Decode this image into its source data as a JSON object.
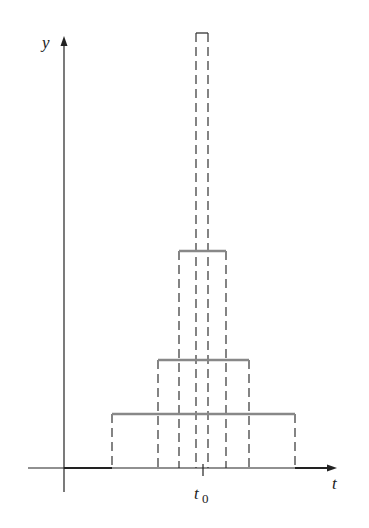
{
  "labels": {
    "y_axis": "y",
    "t_axis": "t",
    "t0": "t",
    "t0_sub": "0"
  },
  "colors": {
    "axis": "#222222",
    "pulse_top": "#888888",
    "dash": "#333333"
  },
  "pulses": [
    {
      "x1": 112,
      "x2": 295,
      "top": 414
    },
    {
      "x1": 158,
      "x2": 249,
      "top": 360
    },
    {
      "x1": 179,
      "x2": 226,
      "top": 251
    },
    {
      "x1": 196,
      "x2": 208,
      "top": 33
    }
  ],
  "axes": {
    "origin_x": 64,
    "origin_y": 468,
    "x_end": 337,
    "y_top": 36,
    "x_start": 28,
    "y_bottom": 492,
    "t0_x": 203
  }
}
